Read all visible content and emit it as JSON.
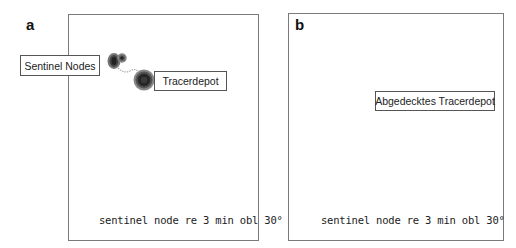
{
  "figure": {
    "panels": [
      {
        "letter": "a",
        "caption": "sentinel node re 3 min obl 30°",
        "labels": {
          "sentinel_nodes": "Sentinel Nodes",
          "tracer_depot": "Tracerdepot"
        }
      },
      {
        "letter": "b",
        "caption": "sentinel node re 3 min obl 30°",
        "labels": {
          "covered_tracer_depot": "Abgedecktes Tracerdepot"
        }
      }
    ],
    "colors": {
      "frame": "#7a7a7a",
      "hotspot_dark": "#2a2a2a",
      "hotspot_ring": "#5a5a5a",
      "shield_disc": "#c8c8c8"
    }
  }
}
